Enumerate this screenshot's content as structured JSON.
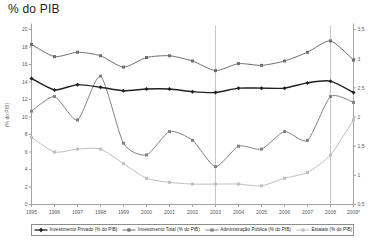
{
  "chart_data": {
    "type": "line",
    "title": "% do PIB",
    "xlabel": "",
    "ylabel": "(% do PIB)",
    "y2label": "",
    "ylim": [
      0,
      20
    ],
    "y2lim": [
      0.5,
      3.5
    ],
    "grid": false,
    "legend_position": "bottom",
    "x": [
      "1995",
      "1996",
      "1997",
      "1998",
      "1999",
      "2000",
      "2001",
      "2002",
      "2003",
      "2004",
      "2005",
      "2006",
      "2007",
      "2008",
      "2009*"
    ],
    "categories": [
      "1995",
      "1996",
      "1997",
      "1998",
      "1999",
      "2000",
      "2001",
      "2002",
      "2003",
      "2004",
      "2005",
      "2006",
      "2007",
      "2008",
      "2009*"
    ],
    "y_ticks": [
      "0",
      "2",
      "4",
      "6",
      "8",
      "10",
      "12",
      "14",
      "16",
      "18",
      "20"
    ],
    "y2_ticks": [
      "0,5",
      "1",
      "1,5",
      "2",
      "2,5",
      "3",
      "3,5"
    ],
    "vertical_reference_lines": [
      "2003",
      "2008"
    ],
    "footnote": "2009*",
    "series": [
      {
        "name": "Investimento Privado (% do PIB)",
        "axis": "left",
        "color": "#231f20",
        "marker": "diamond",
        "values": [
          14.4,
          13.1,
          13.7,
          13.4,
          13.0,
          13.2,
          13.2,
          12.9,
          12.8,
          13.3,
          13.3,
          13.3,
          13.9,
          14.1,
          12.8
        ]
      },
      {
        "name": "Investimento Total (% do PIB)",
        "axis": "left",
        "color": "#6d6e71",
        "marker": "square",
        "values": [
          18.3,
          16.9,
          17.4,
          17.0,
          15.7,
          16.8,
          17.0,
          16.4,
          15.3,
          16.1,
          15.9,
          16.4,
          17.4,
          18.7,
          16.5
        ]
      },
      {
        "name": "Administração Pública (% do PIB)",
        "axis": "right",
        "color": "#808285",
        "marker": "square",
        "values": [
          2.1,
          2.35,
          1.95,
          2.7,
          1.55,
          1.35,
          1.75,
          1.6,
          1.15,
          1.5,
          1.45,
          1.75,
          1.6,
          2.35,
          2.25
        ]
      },
      {
        "name": "Estatais (% do PIB)",
        "axis": "right",
        "color": "#bcbec0",
        "marker": "square",
        "values": [
          1.65,
          1.4,
          1.45,
          1.45,
          1.2,
          0.95,
          0.88,
          0.85,
          0.85,
          0.85,
          0.82,
          0.95,
          1.05,
          1.35,
          1.95
        ]
      }
    ]
  },
  "legend": {
    "items": [
      {
        "label": "Investimento Privado (% do PIB)",
        "color": "#231f20",
        "marker": "diamond"
      },
      {
        "label": "Investimento Total (% do PIB)",
        "color": "#6d6e71",
        "marker": "square"
      },
      {
        "label": "Administração Pública (% do PIB)",
        "color": "#808285",
        "marker": "square"
      },
      {
        "label": "Estatais (% do PIB)",
        "color": "#bcbec0",
        "marker": "square"
      }
    ]
  }
}
